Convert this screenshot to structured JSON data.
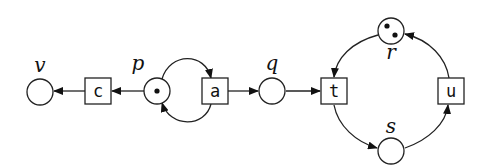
{
  "diagram": {
    "type": "petri-net",
    "places": [
      {
        "id": "v",
        "label": "v",
        "tokens": 0
      },
      {
        "id": "p",
        "label": "p",
        "tokens": 1
      },
      {
        "id": "q",
        "label": "q",
        "tokens": 0
      },
      {
        "id": "r",
        "label": "r",
        "tokens": 2
      },
      {
        "id": "s",
        "label": "s",
        "tokens": 0
      }
    ],
    "transitions": [
      {
        "id": "c",
        "label": "c"
      },
      {
        "id": "a",
        "label": "a"
      },
      {
        "id": "t",
        "label": "t"
      },
      {
        "id": "u",
        "label": "u"
      }
    ],
    "arcs": [
      {
        "from": "p",
        "to": "c"
      },
      {
        "from": "c",
        "to": "v"
      },
      {
        "from": "p",
        "to": "a"
      },
      {
        "from": "a",
        "to": "p"
      },
      {
        "from": "a",
        "to": "q"
      },
      {
        "from": "q",
        "to": "t"
      },
      {
        "from": "r",
        "to": "t"
      },
      {
        "from": "t",
        "to": "s"
      },
      {
        "from": "s",
        "to": "u"
      },
      {
        "from": "u",
        "to": "r"
      }
    ]
  },
  "labels": {
    "v": "v",
    "p": "p",
    "q": "q",
    "r": "r",
    "s": "s",
    "c": "c",
    "a": "a",
    "t": "t",
    "u": "u"
  }
}
